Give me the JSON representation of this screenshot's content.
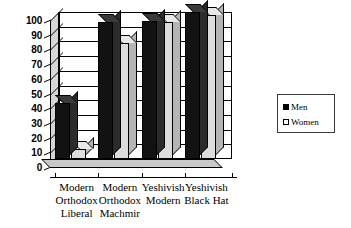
{
  "chart_data": {
    "type": "bar",
    "title": "",
    "xlabel": "",
    "ylabel": "",
    "ylim": [
      0,
      100
    ],
    "ytick_labels": [
      "100",
      "90",
      "80",
      "70",
      "60",
      "50",
      "40",
      "30",
      "20",
      "10",
      "0"
    ],
    "ytick_values": [
      100,
      90,
      80,
      70,
      60,
      50,
      40,
      30,
      20,
      10,
      0
    ],
    "grid": true,
    "legend_position": "right",
    "categories": [
      "Modern Orthodox Liberal",
      "Modern Orthodox Machmir",
      "Yeshivish Modern",
      "Yeshivish Black Hat"
    ],
    "category_lines": [
      [
        "Modern",
        "Orthodox",
        "Liberal"
      ],
      [
        "Modern",
        "Orthodox",
        "Machmir"
      ],
      [
        "Yeshivish",
        "Modern"
      ],
      [
        "Yeshivish",
        "Black Hat"
      ]
    ],
    "series": [
      {
        "name": "Men",
        "color": "#000000",
        "values": [
          38,
          93,
          94,
          100
        ]
      },
      {
        "name": "Women",
        "color": "#dcdcdc",
        "values": [
          7,
          79,
          93,
          98
        ]
      }
    ]
  },
  "legend": {
    "men_label": "Men",
    "women_label": "Women"
  }
}
